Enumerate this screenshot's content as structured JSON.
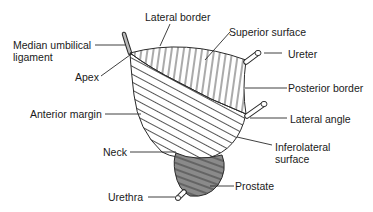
{
  "diagram": {
    "colors": {
      "line": "#2a2a2a",
      "background": "#ffffff",
      "prostate_fill": "#8a8a8a"
    },
    "labels": {
      "lateral_border": "Lateral border",
      "superior_surface": "Superior surface",
      "median_umbilical_ligament_1": "Median umbilical",
      "median_umbilical_ligament_2": "ligament",
      "apex": "Apex",
      "ureter": "Ureter",
      "posterior_border": "Posterior border",
      "anterior_margin": "Anterior margin",
      "lateral_angle": "Lateral angle",
      "neck": "Neck",
      "inferolateral_surface_1": "Inferolateral",
      "inferolateral_surface_2": "surface",
      "prostate": "Prostate",
      "urethra": "Urethra"
    }
  }
}
